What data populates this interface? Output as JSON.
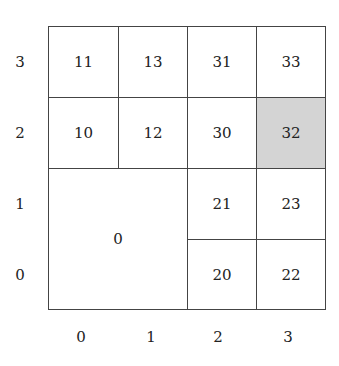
{
  "diagram": {
    "type": "quadtree-grid",
    "y_labels": [
      "3",
      "2",
      "1",
      "0"
    ],
    "x_labels": [
      "0",
      "1",
      "2",
      "3"
    ],
    "cells": [
      {
        "label": "11",
        "col": 0,
        "row": 3,
        "w": 1,
        "h": 1,
        "shaded": false
      },
      {
        "label": "13",
        "col": 1,
        "row": 3,
        "w": 1,
        "h": 1,
        "shaded": false
      },
      {
        "label": "31",
        "col": 2,
        "row": 3,
        "w": 1,
        "h": 1,
        "shaded": false
      },
      {
        "label": "33",
        "col": 3,
        "row": 3,
        "w": 1,
        "h": 1,
        "shaded": false
      },
      {
        "label": "10",
        "col": 0,
        "row": 2,
        "w": 1,
        "h": 1,
        "shaded": false
      },
      {
        "label": "12",
        "col": 1,
        "row": 2,
        "w": 1,
        "h": 1,
        "shaded": false
      },
      {
        "label": "30",
        "col": 2,
        "row": 2,
        "w": 1,
        "h": 1,
        "shaded": false
      },
      {
        "label": "32",
        "col": 3,
        "row": 2,
        "w": 1,
        "h": 1,
        "shaded": true
      },
      {
        "label": "0",
        "col": 0,
        "row": 0,
        "w": 2,
        "h": 2,
        "shaded": false
      },
      {
        "label": "21",
        "col": 2,
        "row": 1,
        "w": 1,
        "h": 1,
        "shaded": false
      },
      {
        "label": "23",
        "col": 3,
        "row": 1,
        "w": 1,
        "h": 1,
        "shaded": false
      },
      {
        "label": "20",
        "col": 2,
        "row": 0,
        "w": 1,
        "h": 1,
        "shaded": false
      },
      {
        "label": "22",
        "col": 3,
        "row": 0,
        "w": 1,
        "h": 1,
        "shaded": false
      }
    ],
    "colors": {
      "shaded": "#d4d4d4",
      "border": "#444444"
    }
  }
}
